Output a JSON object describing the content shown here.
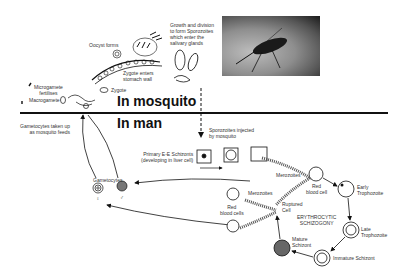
{
  "diagram": {
    "regions": {
      "mosquito": "In mosquito",
      "man": "In man"
    },
    "labels": {
      "growth_division": [
        "Growth and division",
        "to form Sporozoites",
        "which enter the",
        "salivary glands"
      ],
      "oocyst_forms": "Oocyst forms",
      "zygote_enters": [
        "Zygote enters",
        "stomach wall"
      ],
      "zygote": "Zygote",
      "microgamete": [
        "Microgamete",
        "fertilises"
      ],
      "macrogamete": "Macrogamete",
      "gametocytes_taken_up": [
        "Gametocytes taken up",
        "as mosquito feeds"
      ],
      "sporozoites_injected": [
        "Sporozoites injected",
        "by mosquito"
      ],
      "primary_ee": [
        "Primary E-E Schizonts",
        "(developing in liver cell)"
      ],
      "gametocytes": "Gametocytes",
      "female_symbol": "♀",
      "male_symbol": "♂",
      "merozoites_top": "Merozoites",
      "red_blood_cell": [
        "Red",
        "blood cell"
      ],
      "merozoites_left": "Merozoites",
      "red_blood_cells": [
        "Red",
        "blood cells"
      ],
      "ruptured_cell": [
        "Ruptured",
        "Cell"
      ],
      "erythrocytic": [
        "ERYTHROCYTIC",
        "SCHIZOGONY"
      ],
      "early_trophozoite": [
        "Early",
        "Trophozoite"
      ],
      "late_trophozoite": [
        "Late",
        "Trophozoite"
      ],
      "mature_schizont": [
        "Mature",
        "Schizont"
      ],
      "immature_schizont": "Immature Schizont"
    },
    "photo": {
      "subject": "mosquito-photo"
    },
    "colors": {
      "line": "#111111",
      "text": "#333333",
      "background": "#ffffff"
    }
  }
}
